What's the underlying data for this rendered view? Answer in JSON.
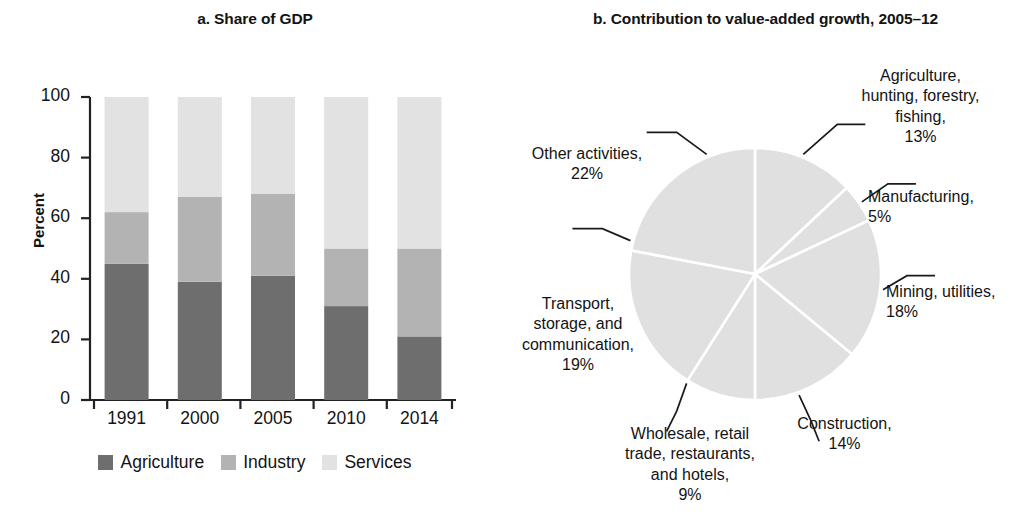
{
  "panel_a": {
    "title": "a. Share of GDP",
    "y_axis_title": "Percent",
    "legend": [
      {
        "label": "Agriculture",
        "color": "#6e6e6e"
      },
      {
        "label": "Industry",
        "color": "#b3b3b3"
      },
      {
        "label": "Services",
        "color": "#e2e2e2"
      }
    ]
  },
  "panel_b": {
    "title": "b. Contribution to value-added growth, 2005–12",
    "labels": {
      "agriculture": {
        "lines": [
          "Agriculture,",
          "hunting, forestry,",
          "fishing,",
          "13%"
        ]
      },
      "manufacturing": {
        "lines": [
          "Manufacturing,",
          "5%"
        ]
      },
      "mining": {
        "lines": [
          "Mining, utilities,",
          "18%"
        ]
      },
      "construction": {
        "lines": [
          "Construction,",
          "14%"
        ]
      },
      "wholesale": {
        "lines": [
          "Wholesale, retail",
          "trade, restaurants,",
          "and hotels,",
          "9%"
        ]
      },
      "transport": {
        "lines": [
          "Transport,",
          "storage, and",
          "communication,",
          "19%"
        ]
      },
      "other": {
        "lines": [
          "Other activities,",
          "22%"
        ]
      }
    }
  },
  "chart_data": [
    {
      "type": "bar",
      "title": "a. Share of GDP",
      "subtype": "stacked-100",
      "xlabel": "",
      "ylabel": "Percent",
      "ylim": [
        0,
        100
      ],
      "yticks": [
        0,
        20,
        40,
        60,
        80,
        100
      ],
      "grid": false,
      "legend_position": "bottom",
      "categories": [
        "1991",
        "2000",
        "2005",
        "2010",
        "2014"
      ],
      "series": [
        {
          "name": "Agriculture",
          "color": "#6e6e6e",
          "values": [
            45,
            39,
            41,
            31,
            21
          ]
        },
        {
          "name": "Industry",
          "color": "#b3b3b3",
          "values": [
            17,
            28,
            27,
            19,
            29
          ]
        },
        {
          "name": "Services",
          "color": "#e2e2e2",
          "values": [
            38,
            33,
            32,
            50,
            50
          ]
        }
      ]
    },
    {
      "type": "pie",
      "title": "b. Contribution to value-added growth, 2005–12",
      "unit": "%",
      "start_angle_deg": 0,
      "direction": "clockwise",
      "slice_color": "#e0e0e0",
      "labels": [
        "Agriculture, hunting, forestry, fishing",
        "Manufacturing",
        "Mining, utilities",
        "Construction",
        "Wholesale, retail trade, restaurants, and hotels",
        "Transport, storage, and communication",
        "Other activities"
      ],
      "values": [
        13,
        5,
        18,
        14,
        9,
        19,
        22
      ]
    }
  ]
}
